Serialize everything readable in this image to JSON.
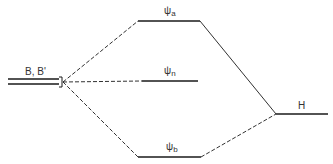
{
  "diagram": {
    "type": "molecular-orbital-energy-diagram",
    "left_level": {
      "label": "B, B'"
    },
    "right_level": {
      "label": "H"
    },
    "orbitals": [
      {
        "symbol": "ψ",
        "sub": "a",
        "name": "antibonding"
      },
      {
        "symbol": "ψ",
        "sub": "n",
        "name": "nonbonding"
      },
      {
        "symbol": "ψ",
        "sub": "b",
        "name": "bonding"
      }
    ],
    "colors": {
      "line": "#1a1a1a",
      "text": "#333333",
      "background": "#ffffff"
    }
  }
}
